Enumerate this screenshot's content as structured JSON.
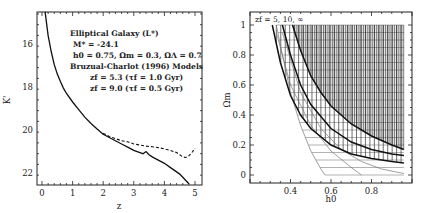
{
  "chart_data": [
    {
      "type": "line",
      "title": "",
      "xlabel": "z",
      "ylabel": "K'",
      "xlim": [
        -0.15,
        5.3
      ],
      "ylim": [
        22.55,
        14.5
      ],
      "y_inverted": true,
      "x_ticks": [
        "0",
        "1",
        "2",
        "3",
        "4",
        "5"
      ],
      "y_ticks": [
        "16",
        "18",
        "20",
        "22"
      ],
      "grid": false,
      "annotations": [
        "Elliptical Galaxy (L*)",
        "M* = -24.1",
        "h0 = 0.75, Ωm = 0.3, ΩΛ = 0.7",
        "Bruzual-Charlot (1996) Models",
        "zf = 5.3 (τf = 1.0 Gyr)",
        "zf = 9.0 (τf = 0.5 Gyr)"
      ],
      "series": [
        {
          "name": "zf = 5.3 (τf = 1.0 Gyr)",
          "style": "solid",
          "x": [
            0.1,
            0.2,
            0.3,
            0.4,
            0.5,
            0.6,
            0.7,
            0.8,
            1.0,
            1.2,
            1.4,
            1.6,
            1.8,
            2.0,
            2.2,
            2.4,
            2.6,
            2.8,
            3.0,
            3.2,
            3.3,
            3.4,
            3.5,
            3.6,
            3.8,
            4.0,
            4.2,
            4.4,
            4.5,
            4.6,
            4.7,
            4.8
          ],
          "y": [
            14.5,
            15.6,
            16.35,
            16.95,
            17.4,
            17.75,
            18.05,
            18.3,
            18.7,
            19.05,
            19.4,
            19.7,
            19.95,
            20.2,
            20.35,
            20.5,
            20.65,
            20.8,
            20.95,
            21.05,
            21.1,
            21.0,
            21.15,
            21.25,
            21.4,
            21.55,
            21.75,
            21.95,
            22.05,
            22.2,
            22.35,
            22.5
          ]
        },
        {
          "name": "zf = 9.0 (τf = 0.5 Gyr)",
          "style": "dashed",
          "x": [
            2.0,
            2.2,
            2.4,
            2.6,
            2.8,
            3.0,
            3.2,
            3.4,
            3.6,
            3.8,
            4.0,
            4.2,
            4.4,
            4.5,
            4.6,
            4.7,
            4.8,
            4.9,
            5.0
          ],
          "y": [
            20.15,
            20.3,
            20.4,
            20.5,
            20.55,
            20.65,
            20.7,
            20.75,
            20.78,
            20.82,
            20.88,
            20.95,
            21.05,
            21.15,
            21.25,
            21.28,
            21.2,
            21.05,
            20.85
          ]
        }
      ]
    },
    {
      "type": "line",
      "title": "",
      "xlabel": "h0",
      "ylabel": "Ωm",
      "xlim": [
        0.2,
        1.0
      ],
      "ylim": [
        -0.05,
        1.09
      ],
      "x_ticks": [
        "0.4",
        "0.6",
        "0.8"
      ],
      "y_ticks": [
        "0",
        "0.2",
        "0.4",
        "0.6",
        "0.8",
        "1"
      ],
      "grid": false,
      "annotations": [
        "zf = 5, 10, ∞"
      ],
      "legend": "none",
      "series": [
        {
          "name": "thin boundary 1",
          "style": "thin",
          "x": [
            0.33,
            0.36,
            0.4,
            0.45,
            0.5,
            0.55,
            0.57
          ],
          "y": [
            1.0,
            0.8,
            0.55,
            0.33,
            0.16,
            0.04,
            0.0
          ]
        },
        {
          "name": "thin boundary 2",
          "style": "thin",
          "x": [
            0.33,
            0.4,
            0.5,
            0.6,
            0.7,
            0.75
          ],
          "y": [
            0.95,
            0.6,
            0.33,
            0.16,
            0.05,
            0.0
          ]
        },
        {
          "name": "thin boundary 3",
          "style": "thin",
          "x": [
            0.36,
            0.45,
            0.55,
            0.65,
            0.75,
            0.85,
            0.96
          ],
          "y": [
            0.95,
            0.55,
            0.31,
            0.17,
            0.09,
            0.04,
            0.01
          ]
        },
        {
          "name": "zf = 5 (thick)",
          "style": "thick",
          "x": [
            0.31,
            0.35,
            0.4,
            0.45,
            0.5,
            0.6,
            0.7,
            0.8,
            0.9,
            0.96
          ],
          "y": [
            1.0,
            0.75,
            0.53,
            0.4,
            0.31,
            0.2,
            0.14,
            0.11,
            0.09,
            0.08
          ]
        },
        {
          "name": "zf = 10 (thick)",
          "style": "thick",
          "x": [
            0.36,
            0.4,
            0.45,
            0.5,
            0.6,
            0.7,
            0.8,
            0.9,
            0.96
          ],
          "y": [
            1.0,
            0.8,
            0.6,
            0.47,
            0.31,
            0.22,
            0.17,
            0.14,
            0.13
          ]
        },
        {
          "name": "zf = ∞ (thick)",
          "style": "thick",
          "x": [
            0.41,
            0.45,
            0.5,
            0.55,
            0.6,
            0.7,
            0.8,
            0.9,
            0.96
          ],
          "y": [
            1.0,
            0.83,
            0.66,
            0.55,
            0.46,
            0.34,
            0.26,
            0.2,
            0.17
          ]
        }
      ],
      "shading": {
        "horizontal_hatch": "region between thin and thick boundaries, h0 up to 0.96",
        "vertical_hatch": "region above zf curves up to Ωm = 1, h0 up to 0.96",
        "dense_vertical_hatch": "region above zf = ∞ curve"
      }
    }
  ]
}
